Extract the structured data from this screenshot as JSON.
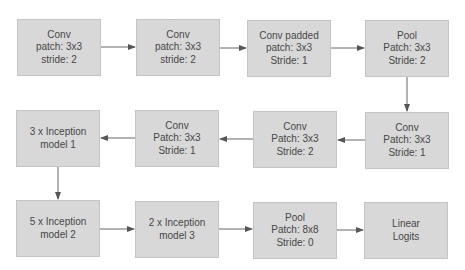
{
  "diagram": {
    "type": "flowchart",
    "colors": {
      "box_fill": "#d8d8d8",
      "box_border": "#c4c4c4",
      "text": "#474747",
      "arrow": "#555555"
    },
    "nodes": [
      {
        "id": "n1",
        "lines": [
          "Conv",
          "patch: 3x3",
          "stride: 2"
        ]
      },
      {
        "id": "n2",
        "lines": [
          "Conv",
          "patch: 3x3",
          "stride: 2"
        ]
      },
      {
        "id": "n3",
        "lines": [
          "Conv padded",
          "patch: 3x3",
          "Stride: 1"
        ]
      },
      {
        "id": "n4",
        "lines": [
          "Pool",
          "Patch: 3x3",
          "Stride: 2"
        ]
      },
      {
        "id": "n5",
        "lines": [
          "Conv",
          "Patch: 3x3",
          "Stride: 1"
        ]
      },
      {
        "id": "n6",
        "lines": [
          "Conv",
          "Patch: 3x3",
          "Stride: 2"
        ]
      },
      {
        "id": "n7",
        "lines": [
          "Conv",
          "Patch: 3x3",
          "Stride: 1"
        ]
      },
      {
        "id": "n8",
        "lines": [
          "3 x Inception",
          "model 1"
        ]
      },
      {
        "id": "n9",
        "lines": [
          "5 x Inception",
          "model 2"
        ]
      },
      {
        "id": "n10",
        "lines": [
          "2 x Inception",
          "model 3"
        ]
      },
      {
        "id": "n11",
        "lines": [
          "Pool",
          "Patch: 8x8",
          "Stride: 0"
        ]
      },
      {
        "id": "n12",
        "lines": [
          "Linear",
          "Logits"
        ]
      }
    ],
    "edges": [
      [
        "n1",
        "n2"
      ],
      [
        "n2",
        "n3"
      ],
      [
        "n3",
        "n4"
      ],
      [
        "n4",
        "n5"
      ],
      [
        "n5",
        "n6"
      ],
      [
        "n6",
        "n7"
      ],
      [
        "n7",
        "n8"
      ],
      [
        "n8",
        "n9"
      ],
      [
        "n9",
        "n10"
      ],
      [
        "n10",
        "n11"
      ],
      [
        "n11",
        "n12"
      ]
    ]
  }
}
